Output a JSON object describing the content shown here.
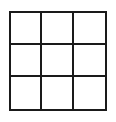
{
  "board": {
    "rows": 3,
    "cols": 3,
    "line_color": "#1a1a1a",
    "cells": [
      "",
      "",
      "",
      "",
      "",
      "",
      "",
      "",
      ""
    ]
  }
}
